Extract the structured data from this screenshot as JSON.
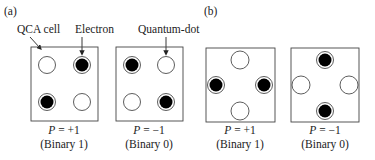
{
  "panels": {
    "a": {
      "label": "(a)"
    },
    "b": {
      "label": "(b)"
    }
  },
  "annotations": {
    "cell": "QCA cell",
    "electron": "Electron",
    "dot": "Quantum-dot"
  },
  "cells": [
    {
      "p_var": "P",
      "p_val": " = +1",
      "binary": "(Binary 1)"
    },
    {
      "p_var": "P",
      "p_val": " = −1",
      "binary": "(Binary 0)"
    },
    {
      "p_var": "P",
      "p_val": " = +1",
      "binary": "(Binary 1)"
    },
    {
      "p_var": "P",
      "p_val": " = −1",
      "binary": "(Binary 0)"
    }
  ]
}
